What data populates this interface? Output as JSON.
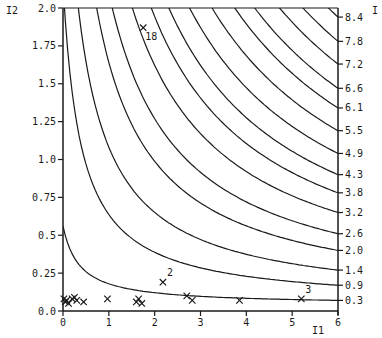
{
  "chart_data": {
    "type": "scatter",
    "title": "",
    "xlabel": "I1",
    "ylabel": "I2",
    "right_axis_label": "I",
    "xlim": [
      0,
      6
    ],
    "ylim": [
      0,
      2.0
    ],
    "grid": false,
    "legend": null,
    "x_ticks": [
      "0",
      "1",
      "2",
      "3",
      "4",
      "5",
      "6"
    ],
    "y_ticks": [
      "0.0",
      "0.25",
      "0.5",
      "0.75",
      "1.0",
      "1.25",
      "1.5",
      "1.75",
      "2.0"
    ],
    "contour_labels_right": [
      "8.4",
      "7.8",
      "7.2",
      "6.6",
      "6.1",
      "5.5",
      "4.9",
      "4.3",
      "3.8",
      "3.2",
      "2.6",
      "2.0",
      "1.4",
      "0.9",
      "0.3"
    ],
    "contours": [
      {
        "level": "8.4",
        "y_at_x6": 1.94
      },
      {
        "level": "7.8",
        "y_at_x6": 1.78
      },
      {
        "level": "7.2",
        "y_at_x6": 1.63
      },
      {
        "level": "6.6",
        "y_at_x6": 1.47
      },
      {
        "level": "6.1",
        "y_at_x6": 1.34
      },
      {
        "level": "5.5",
        "y_at_x6": 1.19
      },
      {
        "level": "4.9",
        "y_at_x6": 1.04
      },
      {
        "level": "4.3",
        "y_at_x6": 0.9
      },
      {
        "level": "3.8",
        "y_at_x6": 0.78
      },
      {
        "level": "3.2",
        "y_at_x6": 0.65
      },
      {
        "level": "2.6",
        "y_at_x6": 0.51
      },
      {
        "level": "2.0",
        "y_at_x6": 0.4
      },
      {
        "level": "1.4",
        "y_at_x6": 0.27
      },
      {
        "level": "0.9",
        "y_at_x6": 0.17
      },
      {
        "level": "0.3",
        "y_at_x6": 0.07
      }
    ],
    "points": [
      {
        "x": 0.02,
        "y": 0.08,
        "label": ""
      },
      {
        "x": 0.05,
        "y": 0.06,
        "label": ""
      },
      {
        "x": 0.08,
        "y": 0.07,
        "label": ""
      },
      {
        "x": 0.12,
        "y": 0.05,
        "label": ""
      },
      {
        "x": 0.2,
        "y": 0.08,
        "label": ""
      },
      {
        "x": 0.25,
        "y": 0.09,
        "label": ""
      },
      {
        "x": 0.3,
        "y": 0.07,
        "label": ""
      },
      {
        "x": 0.45,
        "y": 0.06,
        "label": ""
      },
      {
        "x": 0.97,
        "y": 0.08,
        "label": ""
      },
      {
        "x": 1.6,
        "y": 0.06,
        "label": ""
      },
      {
        "x": 1.65,
        "y": 0.08,
        "label": ""
      },
      {
        "x": 1.72,
        "y": 0.05,
        "label": ""
      },
      {
        "x": 2.18,
        "y": 0.19,
        "label": "2"
      },
      {
        "x": 2.7,
        "y": 0.1,
        "label": ""
      },
      {
        "x": 2.82,
        "y": 0.07,
        "label": ""
      },
      {
        "x": 3.85,
        "y": 0.07,
        "label": ""
      },
      {
        "x": 5.2,
        "y": 0.08,
        "label": "3"
      },
      {
        "x": 1.75,
        "y": 1.87,
        "label": "18"
      }
    ]
  }
}
